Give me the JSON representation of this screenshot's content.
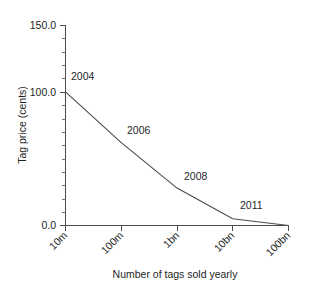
{
  "chart_data": {
    "type": "line",
    "title": "",
    "xlabel": "Number of tags sold yearly",
    "ylabel": "Tag price (cents)",
    "categories": [
      "10m",
      "100m",
      "1bn",
      "10bn",
      "100bn"
    ],
    "x_scale": "log-category",
    "values": [
      100.0,
      62.0,
      28.0,
      5.0,
      0.0
    ],
    "series": [
      {
        "name": "Tag price",
        "values": [
          100.0,
          62.0,
          28.0,
          5.0,
          0.0
        ]
      }
    ],
    "ylim": [
      0.0,
      150.0
    ],
    "y_ticks_major": [
      "150.0",
      "100.0",
      "0.0"
    ],
    "y_tick_major_values": [
      150.0,
      100.0,
      0.0
    ],
    "y_minor_tick_step": 10,
    "grid": false,
    "legend": "none",
    "x_tick_label_rotation": -45,
    "annotations": [
      {
        "label": "2004",
        "x_category": "10m",
        "y_value": 100.0
      },
      {
        "label": "2006",
        "x_category": "100m",
        "y_value": 62.0
      },
      {
        "label": "2008",
        "x_category": "1bn",
        "y_value": 28.0
      },
      {
        "label": "2011",
        "x_category": "10bn",
        "y_value": 5.0
      }
    ],
    "colors": {
      "line": "#4a4a4a",
      "axis": "#4d4d4d",
      "text": "#1f1f1f",
      "background": "#ffffff"
    }
  },
  "axis": {
    "y_label_top": "150.0",
    "y_label_mid": "100.0",
    "y_label_bottom": "0.0",
    "y_title": "Tag price (cents)",
    "x_title": "Number of tags sold yearly",
    "x_label_1": "10m",
    "x_label_2": "100m",
    "x_label_3": "1bn",
    "x_label_4": "10bn",
    "x_label_5": "100bn"
  },
  "annotations": {
    "a1": "2004",
    "a2": "2006",
    "a3": "2008",
    "a4": "2011"
  }
}
